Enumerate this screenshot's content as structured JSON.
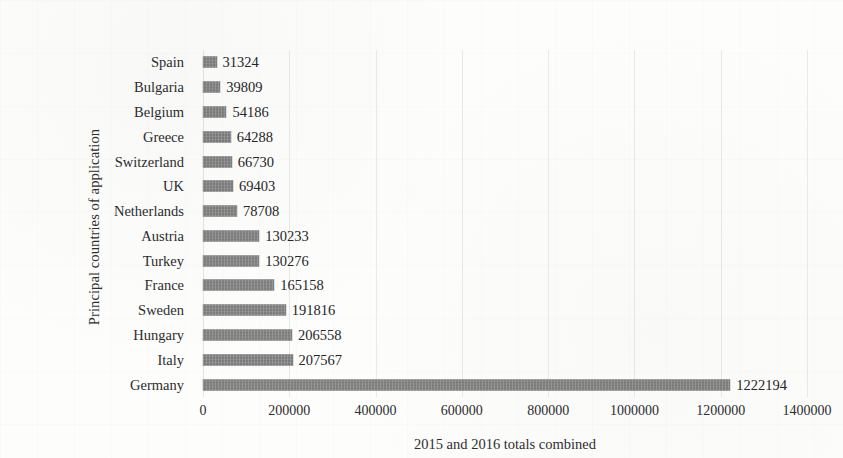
{
  "chart_data": {
    "type": "bar",
    "orientation": "horizontal",
    "title": "",
    "xlabel": "2015 and 2016 totals combined",
    "ylabel": "Principal countries of application",
    "categories": [
      "Spain",
      "Bulgaria",
      "Belgium",
      "Greece",
      "Switzerland",
      "UK",
      "Netherlands",
      "Austria",
      "Turkey",
      "France",
      "Sweden",
      "Hungary",
      "Italy",
      "Germany"
    ],
    "values": [
      31324,
      39809,
      54186,
      64288,
      66730,
      69403,
      78708,
      130233,
      130276,
      165158,
      191816,
      206558,
      207567,
      1222194
    ],
    "value_labels": [
      "31324",
      "39809",
      "54186",
      "64288",
      "66730",
      "69403",
      "78708",
      "130233",
      "130276",
      "165158",
      "191816",
      "206558",
      "207567",
      "1222194"
    ],
    "xlim": [
      0,
      1400000
    ],
    "xticks": [
      0,
      200000,
      400000,
      600000,
      800000,
      1000000,
      1200000,
      1400000
    ],
    "xtick_labels": [
      "0",
      "200000",
      "400000",
      "600000",
      "800000",
      "1000000",
      "1200000",
      "1400000"
    ],
    "grid": true,
    "grid_axis": "x",
    "legend": false,
    "bar_color": "#7c7c7c",
    "background_color": "#fdfdfc",
    "data_labels_shown": true
  }
}
